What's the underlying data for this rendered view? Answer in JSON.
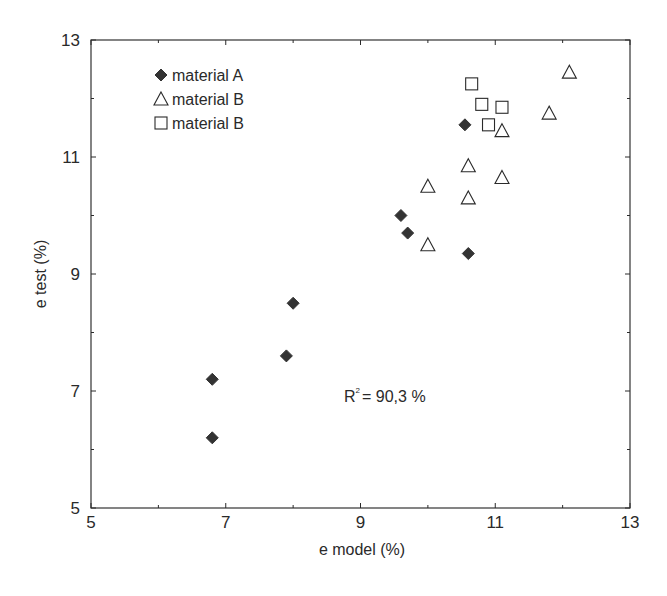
{
  "chart_data": {
    "type": "scatter",
    "title": "",
    "xlabel": "e model (%)",
    "ylabel": "e test (%)",
    "xlim": [
      5,
      13
    ],
    "ylim": [
      5,
      13
    ],
    "xticks": [
      5,
      7,
      9,
      11,
      13
    ],
    "yticks": [
      5,
      7,
      9,
      11,
      13
    ],
    "grid": false,
    "legend_position": "upper-left",
    "annotation": "R² = 90,3 %",
    "annotation_parts": {
      "base": "R",
      "sup": "2",
      "rest": "= 90,3 %"
    },
    "series": [
      {
        "name": "material A",
        "marker": "filled-diamond",
        "points": [
          [
            6.8,
            6.2
          ],
          [
            6.8,
            7.2
          ],
          [
            7.9,
            7.6
          ],
          [
            8.0,
            8.5
          ],
          [
            9.6,
            10.0
          ],
          [
            9.7,
            9.7
          ],
          [
            10.6,
            9.35
          ],
          [
            10.55,
            11.55
          ]
        ]
      },
      {
        "name": "material B",
        "marker": "open-triangle",
        "points": [
          [
            10.0,
            9.5
          ],
          [
            10.0,
            10.5
          ],
          [
            10.6,
            10.3
          ],
          [
            10.6,
            10.85
          ],
          [
            11.1,
            10.65
          ],
          [
            11.1,
            11.45
          ],
          [
            11.8,
            11.75
          ],
          [
            12.1,
            12.45
          ]
        ]
      },
      {
        "name": "material B",
        "marker": "open-square",
        "points": [
          [
            10.65,
            12.25
          ],
          [
            10.8,
            11.9
          ],
          [
            11.1,
            11.85
          ],
          [
            10.9,
            11.55
          ]
        ]
      }
    ]
  },
  "colors": {
    "ink": "#2a2a2a",
    "marker_fill": "#333333",
    "background": "#ffffff"
  }
}
